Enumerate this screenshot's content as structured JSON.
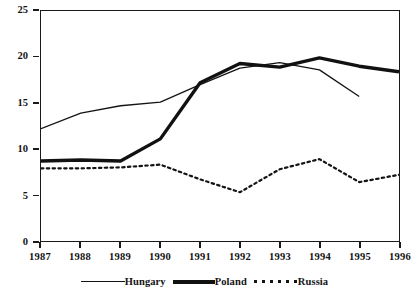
{
  "chart_data": {
    "type": "line",
    "title": "",
    "xlabel": "",
    "ylabel": "",
    "categories": [
      "1987",
      "1988",
      "1989",
      "1990",
      "1991",
      "1992",
      "1993",
      "1994",
      "1995",
      "1996"
    ],
    "x": [
      1987,
      1988,
      1989,
      1990,
      1991,
      1992,
      1993,
      1994,
      1995,
      1996
    ],
    "xlim": [
      1987,
      1996
    ],
    "ylim": [
      0,
      25
    ],
    "yticks": [
      0,
      5,
      10,
      15,
      20,
      25
    ],
    "grid": false,
    "legend_position": "bottom-center",
    "series": [
      {
        "name": "Hungary",
        "style": "thin-solid",
        "color": "#141414",
        "values": [
          12.2,
          13.9,
          14.7,
          15.1,
          17.0,
          18.8,
          19.4,
          18.6,
          15.7,
          null
        ]
      },
      {
        "name": "Poland",
        "style": "thick-solid",
        "color": "#111111",
        "values": [
          8.7,
          8.8,
          8.7,
          11.1,
          17.2,
          19.3,
          18.9,
          19.9,
          19.0,
          18.4
        ]
      },
      {
        "name": "Russia",
        "style": "dotted",
        "color": "#141414",
        "values": [
          7.9,
          7.9,
          8.0,
          8.3,
          6.7,
          5.3,
          7.8,
          8.9,
          6.4,
          7.2
        ]
      }
    ]
  },
  "legend": {
    "items": [
      {
        "label": "Hungary"
      },
      {
        "label": "Poland"
      },
      {
        "label": "Russia"
      }
    ]
  },
  "axes": {
    "y_tick_labels": [
      "25",
      "20",
      "15",
      "10",
      "5",
      "0"
    ],
    "x_tick_labels": [
      "1987",
      "1988",
      "1989",
      "1990",
      "1991",
      "1992",
      "1993",
      "1994",
      "1995",
      "1996"
    ]
  }
}
